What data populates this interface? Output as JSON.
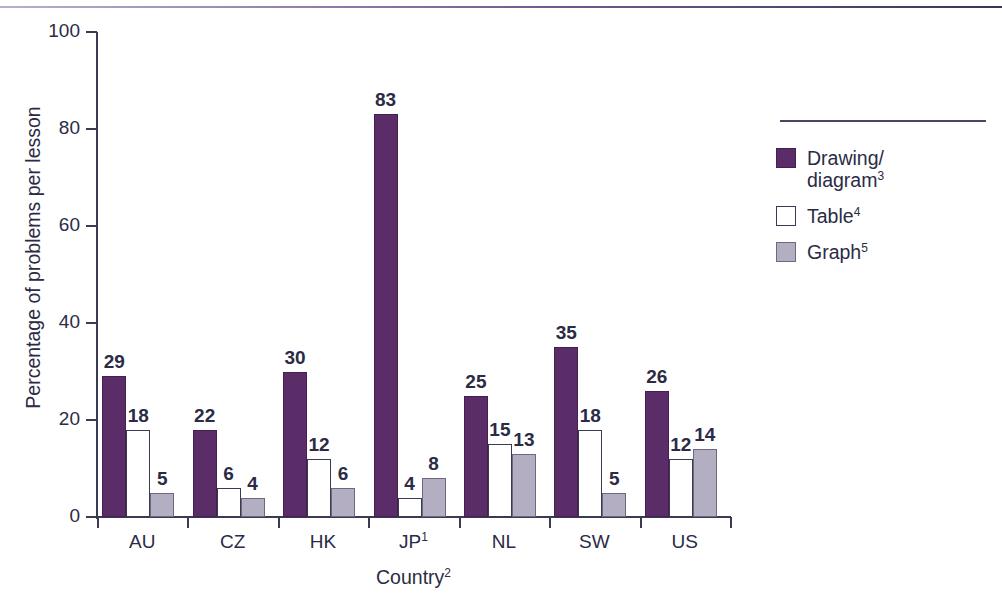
{
  "chart_data": {
    "type": "bar",
    "title": "",
    "subtitle": "",
    "xlabel": "Country",
    "xlabel_superscript": "2",
    "ylabel": "Percentage of problems per lesson",
    "ylim": [
      0,
      100
    ],
    "yticks": [
      0,
      20,
      40,
      60,
      80,
      100
    ],
    "ytick_labels": [
      "0",
      "20",
      "40",
      "60",
      "80",
      "100"
    ],
    "grid": false,
    "legend_position": "right",
    "categories": [
      "AU",
      "CZ",
      "HK",
      "JP",
      "NL",
      "SW",
      "US"
    ],
    "category_superscripts": [
      "",
      "",
      "",
      "1",
      "",
      "",
      ""
    ],
    "series": [
      {
        "name": "Drawing/diagram",
        "superscript": "3",
        "color": "#5a2d68",
        "values": [
          29,
          18,
          30,
          83,
          25,
          35,
          26
        ]
      },
      {
        "name": "Table",
        "superscript": "4",
        "color": "#ffffff",
        "values": [
          18,
          6,
          12,
          4,
          15,
          18,
          12
        ]
      },
      {
        "name": "Graph",
        "superscript": "5",
        "color": "#b3aec2",
        "values": [
          5,
          4,
          6,
          8,
          13,
          5,
          14
        ]
      }
    ],
    "values_by_category": [
      {
        "category": "AU",
        "Drawing/diagram": 29,
        "Table": 18,
        "Graph": 5
      },
      {
        "category": "CZ",
        "Drawing/diagram": 22,
        "Table": 6,
        "Graph": 4
      },
      {
        "category": "HK",
        "Drawing/diagram": 30,
        "Table": 12,
        "Graph": 6
      },
      {
        "category": "JP",
        "Drawing/diagram": 83,
        "Table": 4,
        "Graph": 8
      },
      {
        "category": "NL",
        "Drawing/diagram": 25,
        "Table": 15,
        "Graph": 13
      },
      {
        "category": "SW",
        "Drawing/diagram": 35,
        "Table": 18,
        "Graph": 5
      },
      {
        "category": "US",
        "Drawing/diagram": 26,
        "Table": 12,
        "Graph": 14
      }
    ],
    "bar_labels": [
      [
        "29",
        "18",
        "5"
      ],
      [
        "22",
        "6",
        "4"
      ],
      [
        "30",
        "12",
        "6"
      ],
      [
        "83",
        "4",
        "8"
      ],
      [
        "25",
        "15",
        "13"
      ],
      [
        "35",
        "18",
        "5"
      ],
      [
        "26",
        "12",
        "14"
      ]
    ]
  },
  "legend": {
    "entries": [
      {
        "label": "Drawing/",
        "label_line2": "diagram",
        "superscript": "3"
      },
      {
        "label": "Table",
        "label_line2": "",
        "superscript": "4"
      },
      {
        "label": "Graph",
        "label_line2": "",
        "superscript": "5"
      }
    ]
  },
  "colors": {
    "series_drawing": "#5a2d68",
    "series_table": "#ffffff",
    "series_graph": "#b3aec2",
    "axis": "#3a3a52",
    "text": "#2b2b45",
    "top_rule": "#6f5b8e"
  }
}
